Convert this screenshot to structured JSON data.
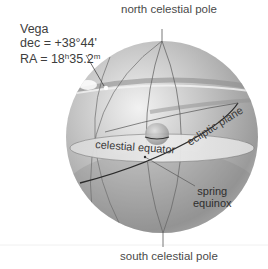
{
  "diagram": {
    "star": {
      "name": "Vega",
      "dec_label": "dec = +38°44'",
      "ra_prefix": "RA = 18",
      "ra_hours_unit": "h",
      "ra_minutes": "35.2",
      "ra_minutes_unit": "m"
    },
    "labels": {
      "north_pole": "north celestial pole",
      "south_pole": "south celestial pole",
      "celestial_equator": "celestial equator",
      "ecliptic_plane": "ecliptic plane",
      "spring_equinox_line1": "spring",
      "spring_equinox_line2": "equinox"
    },
    "colors": {
      "sphere_light": "#e8e8e8",
      "sphere_mid": "#b5b5b5",
      "sphere_dark": "#8c8c8c",
      "equator_plane": "#e6e6e6",
      "ecliptic_line": "#2a2a2a",
      "text": "#4a4a4a"
    }
  }
}
